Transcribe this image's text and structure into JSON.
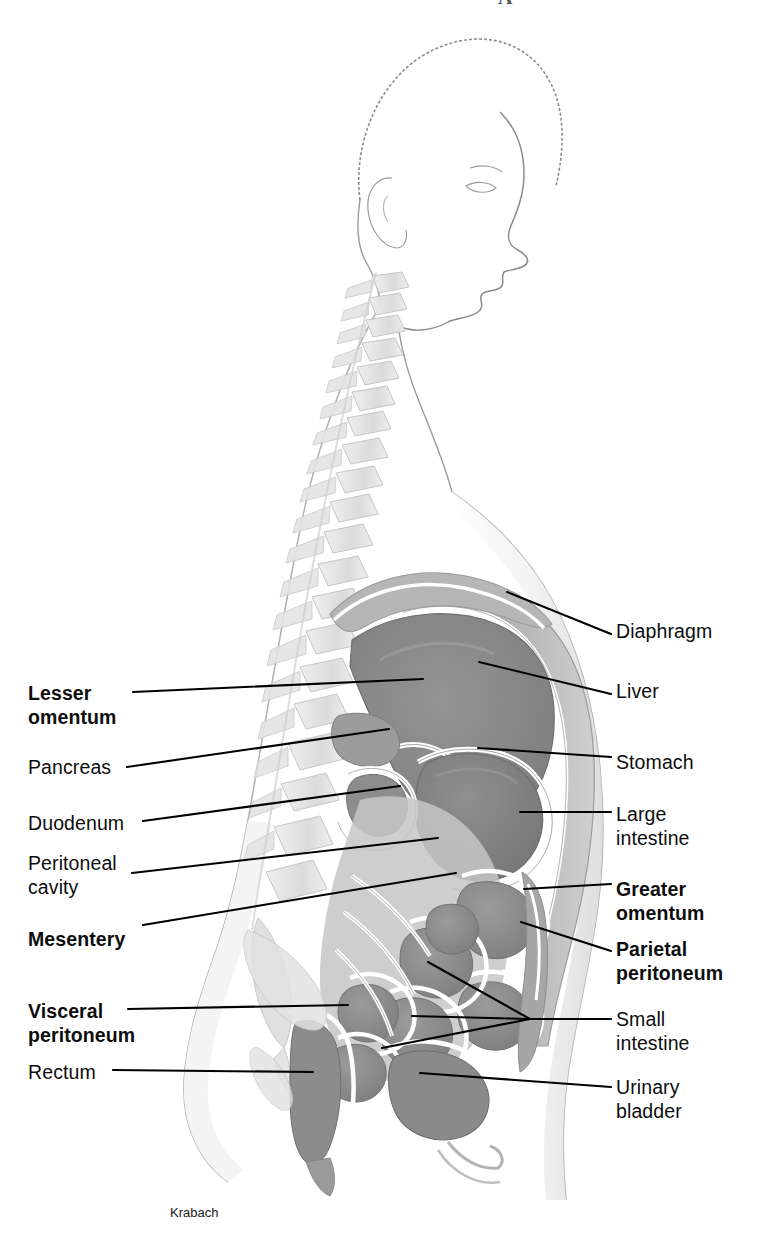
{
  "figure": {
    "title_glyph": "A",
    "credit": "Krabach",
    "view": "midsagittal-section-abdomen"
  },
  "colors": {
    "outline": "#9a9a9a",
    "bone_light": "#d9d9d9",
    "organ_dark": "#8b8b8b",
    "organ_mid": "#a8a8a8",
    "cavity_light": "#c6c6c6",
    "membrane_white": "#ffffff",
    "wall_gray": "#b2b2b2",
    "leader_line": "#000000",
    "text": "#0d0d0d"
  },
  "labels_left": [
    {
      "id": "lesser-omentum",
      "text": "Lesser\nomentum",
      "bold": true,
      "x": 28,
      "y": 682,
      "leader": {
        "x1": 133,
        "y1": 692,
        "x2": 423,
        "y2": 679
      }
    },
    {
      "id": "pancreas",
      "text": "Pancreas",
      "bold": false,
      "x": 28,
      "y": 756,
      "leader": {
        "x1": 127,
        "y1": 767,
        "x2": 389,
        "y2": 729
      }
    },
    {
      "id": "duodenum",
      "text": "Duodenum",
      "bold": false,
      "x": 28,
      "y": 812,
      "leader": {
        "x1": 143,
        "y1": 821,
        "x2": 400,
        "y2": 786
      }
    },
    {
      "id": "peritoneal-cavity",
      "text": "Peritoneal\ncavity",
      "bold": false,
      "x": 28,
      "y": 852,
      "leader": {
        "x1": 132,
        "y1": 873,
        "x2": 438,
        "y2": 838
      }
    },
    {
      "id": "mesentery",
      "text": "Mesentery",
      "bold": true,
      "x": 28,
      "y": 928,
      "leader": {
        "x1": 143,
        "y1": 925,
        "x2": 456,
        "y2": 873
      }
    },
    {
      "id": "visceral-peritoneum",
      "text": "Visceral\nperitoneum",
      "bold": true,
      "x": 28,
      "y": 1000,
      "leader": {
        "x1": 128,
        "y1": 1009,
        "x2": 348,
        "y2": 1005
      }
    },
    {
      "id": "rectum",
      "text": "Rectum",
      "bold": false,
      "x": 28,
      "y": 1061,
      "leader": {
        "x1": 113,
        "y1": 1070,
        "x2": 313,
        "y2": 1072
      }
    }
  ],
  "labels_right": [
    {
      "id": "diaphragm",
      "text": "Diaphragm",
      "bold": false,
      "x": 616,
      "y": 620,
      "leader": {
        "x1": 611,
        "y1": 634,
        "x2": 507,
        "y2": 592
      }
    },
    {
      "id": "liver",
      "text": "Liver",
      "bold": false,
      "x": 616,
      "y": 680,
      "leader": {
        "x1": 611,
        "y1": 694,
        "x2": 479,
        "y2": 662
      }
    },
    {
      "id": "stomach",
      "text": "Stomach",
      "bold": false,
      "x": 616,
      "y": 751,
      "leader": {
        "x1": 611,
        "y1": 757,
        "x2": 478,
        "y2": 748
      }
    },
    {
      "id": "large-intestine",
      "text": "Large\nintestine",
      "bold": false,
      "x": 616,
      "y": 803,
      "leader": {
        "x1": 611,
        "y1": 812,
        "x2": 520,
        "y2": 812
      }
    },
    {
      "id": "greater-omentum",
      "text": "Greater\nomentum",
      "bold": true,
      "x": 616,
      "y": 878,
      "leader": {
        "x1": 611,
        "y1": 884,
        "x2": 524,
        "y2": 889
      }
    },
    {
      "id": "parietal-peritoneum",
      "text": "Parietal\nperitoneum",
      "bold": true,
      "x": 616,
      "y": 938,
      "leader": {
        "x1": 611,
        "y1": 951,
        "x2": 521,
        "y2": 922
      }
    },
    {
      "id": "small-intestine",
      "text": "Small\nintestine",
      "bold": false,
      "x": 616,
      "y": 1008,
      "leader": {
        "x1": 611,
        "y1": 1019,
        "x2": 530,
        "y2": 1019
      }
    },
    {
      "id": "urinary-bladder",
      "text": "Urinary\nbladder",
      "bold": false,
      "x": 616,
      "y": 1076,
      "leader": {
        "x1": 611,
        "y1": 1087,
        "x2": 420,
        "y2": 1073
      }
    }
  ],
  "small_intestine_branches": [
    {
      "x1": 530,
      "y1": 1019,
      "x2": 428,
      "y2": 962
    },
    {
      "x1": 530,
      "y1": 1019,
      "x2": 412,
      "y2": 1016
    },
    {
      "x1": 530,
      "y1": 1019,
      "x2": 382,
      "y2": 1048
    }
  ]
}
